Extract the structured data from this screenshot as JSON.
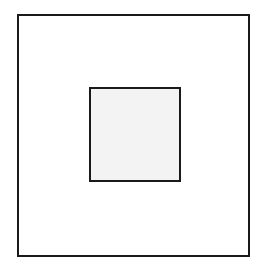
{
  "diagram": {
    "shapes": [
      {
        "id": "outer",
        "type": "square",
        "fill": "#ffffff",
        "stroke": "#1a1a1a"
      },
      {
        "id": "inner",
        "type": "square",
        "fill": "#f3f3f3",
        "stroke": "#1a1a1a"
      }
    ],
    "colors": {
      "background": "#ffffff",
      "stroke": "#1a1a1a",
      "inner_fill": "#f3f3f3"
    }
  }
}
